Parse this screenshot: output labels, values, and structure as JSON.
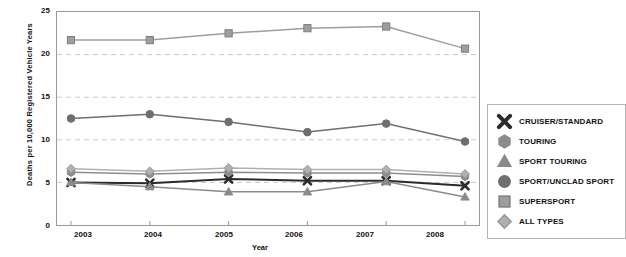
{
  "chart_data": {
    "type": "line",
    "title": "",
    "xlabel": "Year",
    "ylabel": "Deaths per 10,000 Registered Vehicle Years",
    "categories": [
      "2003",
      "2004",
      "2005",
      "2006",
      "2007",
      "2008"
    ],
    "x": [
      2003,
      2004,
      2005,
      2006,
      2007,
      2008
    ],
    "ylim": [
      0,
      25
    ],
    "yticks": [
      "0",
      "5",
      "10",
      "15",
      "20",
      "25"
    ],
    "grid": "horizontal dashed",
    "legend_position": "right",
    "series": [
      {
        "name": "CRUISER/STANDARD",
        "marker": "x-cross",
        "color": "#2b2b2b",
        "values": [
          5.0,
          4.9,
          5.4,
          5.2,
          5.2,
          4.6
        ]
      },
      {
        "name": "TOURING",
        "marker": "hexagon",
        "color": "#8c8c8c",
        "values": [
          6.2,
          6.0,
          6.2,
          6.1,
          6.1,
          5.7
        ]
      },
      {
        "name": "SPORT TOURING",
        "marker": "triangle",
        "color": "#8a8a8a",
        "values": [
          5.0,
          4.5,
          3.9,
          3.9,
          5.1,
          3.3
        ]
      },
      {
        "name": "SPORT/UNCLAD SPORT",
        "marker": "circle",
        "color": "#6f6f6f",
        "values": [
          12.5,
          13.0,
          12.1,
          10.9,
          11.9,
          9.8
        ]
      },
      {
        "name": "SUPERSPORT",
        "marker": "square",
        "color": "#9e9e9e",
        "values": [
          21.7,
          21.7,
          22.5,
          23.1,
          23.3,
          20.7
        ]
      },
      {
        "name": "ALL TYPES",
        "marker": "diamond",
        "color": "#b0b0b0",
        "values": [
          6.6,
          6.3,
          6.7,
          6.5,
          6.5,
          6.0
        ]
      }
    ]
  },
  "legend": {
    "items": [
      {
        "label": "CRUISER/STANDARD"
      },
      {
        "label": "TOURING"
      },
      {
        "label": "SPORT TOURING"
      },
      {
        "label": "SPORT/UNCLAD SPORT"
      },
      {
        "label": "SUPERSPORT"
      },
      {
        "label": "ALL TYPES"
      }
    ]
  }
}
